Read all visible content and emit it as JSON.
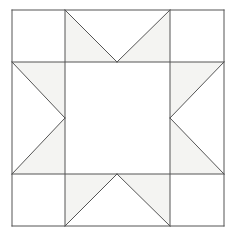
{
  "figure": {
    "name": "sawtooth-star-quilt-block",
    "canvas": {
      "width": 236,
      "height": 238
    },
    "background_color": "#ffffff"
  },
  "geometry": {
    "outer_square": {
      "left": 12,
      "top": 10,
      "right": 224,
      "bottom": 226
    },
    "grid_x": [
      12,
      65,
      170,
      224
    ],
    "grid_y": [
      10,
      62,
      174,
      226
    ],
    "center_top_x": 117,
    "center_bottom_x": 117,
    "center_left_y": 118,
    "center_right_y": 118
  },
  "style": {
    "stroke_color": "#555555",
    "stroke_width": 1,
    "shaded_fill": "#f4f4f2",
    "plain_fill": "#ffffff"
  },
  "patches": [
    {
      "id": "corner-top-left",
      "label": "Corner square top left",
      "fill": "#ffffff",
      "points": "12,10 65,10 65,62 12,62"
    },
    {
      "id": "corner-top-right",
      "label": "Corner square top right",
      "fill": "#ffffff",
      "points": "170,10 224,10 224,62 170,62"
    },
    {
      "id": "corner-bottom-left",
      "label": "Corner square bottom left",
      "fill": "#ffffff",
      "points": "12,174 65,174 65,226 12,226"
    },
    {
      "id": "corner-bottom-right",
      "label": "Corner square bottom right",
      "fill": "#ffffff",
      "points": "170,174 224,174 224,226 170,226"
    },
    {
      "id": "center-square",
      "label": "Center square",
      "fill": "#ffffff",
      "points": "65,62 170,62 170,174 65,174"
    },
    {
      "id": "star-point-top-left",
      "label": "Top star point left half",
      "fill": "#f4f4f2",
      "points": "65,10 117,62 65,62"
    },
    {
      "id": "star-point-top-right",
      "label": "Top star point right half",
      "fill": "#f4f4f2",
      "points": "170,10 170,62 117,62"
    },
    {
      "id": "star-point-top-center",
      "label": "Top background triangle",
      "fill": "#ffffff",
      "points": "65,10 170,10 117,62"
    },
    {
      "id": "star-point-bot-left",
      "label": "Bottom star point left half",
      "fill": "#f4f4f2",
      "points": "65,226 65,174 117,174"
    },
    {
      "id": "star-point-bot-right",
      "label": "Bottom star point right half",
      "fill": "#f4f4f2",
      "points": "170,226 117,174 170,174"
    },
    {
      "id": "star-point-bot-center",
      "label": "Bottom background triangle",
      "fill": "#ffffff",
      "points": "65,226 117,174 170,226"
    },
    {
      "id": "star-point-left-top",
      "label": "Left star point upper half",
      "fill": "#f4f4f2",
      "points": "12,62 65,62 65,118"
    },
    {
      "id": "star-point-left-bot",
      "label": "Left star point lower half",
      "fill": "#f4f4f2",
      "points": "12,174 65,118 65,174"
    },
    {
      "id": "star-point-left-mid",
      "label": "Left background triangle",
      "fill": "#ffffff",
      "points": "12,62 65,118 12,174"
    },
    {
      "id": "star-point-right-top",
      "label": "Right star point upper half",
      "fill": "#f4f4f2",
      "points": "224,62 170,118 170,62"
    },
    {
      "id": "star-point-right-bot",
      "label": "Right star point lower half",
      "fill": "#f4f4f2",
      "points": "224,174 170,174 170,118"
    },
    {
      "id": "star-point-right-mid",
      "label": "Right background triangle",
      "fill": "#ffffff",
      "points": "224,62 224,174 170,118"
    }
  ],
  "lines": [
    {
      "id": "outer-border-top",
      "label": "Outer border top",
      "x1": 12,
      "y1": 10,
      "x2": 224,
      "y2": 10
    },
    {
      "id": "outer-border-right",
      "label": "Outer border right",
      "x1": 224,
      "y1": 10,
      "x2": 224,
      "y2": 226
    },
    {
      "id": "outer-border-bottom",
      "label": "Outer border bottom",
      "x1": 224,
      "y1": 226,
      "x2": 12,
      "y2": 226
    },
    {
      "id": "outer-border-left",
      "label": "Outer border left",
      "x1": 12,
      "y1": 226,
      "x2": 12,
      "y2": 10
    },
    {
      "id": "grid-line-horizontal-1",
      "label": "Upper horizontal grid line",
      "x1": 12,
      "y1": 62,
      "x2": 224,
      "y2": 62
    },
    {
      "id": "grid-line-horizontal-2",
      "label": "Lower horizontal grid line",
      "x1": 12,
      "y1": 174,
      "x2": 224,
      "y2": 174
    },
    {
      "id": "grid-line-vertical-1",
      "label": "Left vertical grid line",
      "x1": 65,
      "y1": 10,
      "x2": 65,
      "y2": 226
    },
    {
      "id": "grid-line-vertical-2",
      "label": "Right vertical grid line",
      "x1": 170,
      "y1": 10,
      "x2": 170,
      "y2": 226
    },
    {
      "id": "diagonal-top-left",
      "label": "Top left diagonal",
      "x1": 65,
      "y1": 10,
      "x2": 117,
      "y2": 62
    },
    {
      "id": "diagonal-top-right",
      "label": "Top right diagonal",
      "x1": 170,
      "y1": 10,
      "x2": 117,
      "y2": 62
    },
    {
      "id": "diagonal-bottom-left",
      "label": "Bottom left diagonal",
      "x1": 65,
      "y1": 226,
      "x2": 117,
      "y2": 174
    },
    {
      "id": "diagonal-bottom-right",
      "label": "Bottom right diagonal",
      "x1": 170,
      "y1": 226,
      "x2": 117,
      "y2": 174
    },
    {
      "id": "diagonal-left-upper",
      "label": "Left upper diagonal",
      "x1": 12,
      "y1": 62,
      "x2": 65,
      "y2": 118
    },
    {
      "id": "diagonal-left-lower",
      "label": "Left lower diagonal",
      "x1": 12,
      "y1": 174,
      "x2": 65,
      "y2": 118
    },
    {
      "id": "diagonal-right-upper",
      "label": "Right upper diagonal",
      "x1": 224,
      "y1": 62,
      "x2": 170,
      "y2": 118
    },
    {
      "id": "diagonal-right-lower",
      "label": "Right lower diagonal",
      "x1": 224,
      "y1": 174,
      "x2": 170,
      "y2": 118
    }
  ]
}
